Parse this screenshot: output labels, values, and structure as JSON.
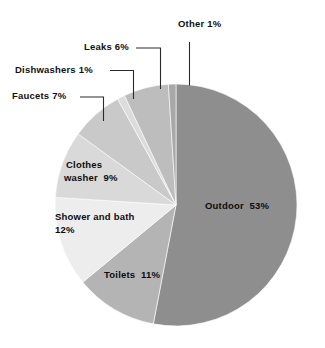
{
  "chart_data": {
    "type": "pie",
    "title": "",
    "subtitle": "",
    "xlabel": "",
    "ylabel": "",
    "legend_position": "none",
    "grid": false,
    "units": "percent",
    "start_angle_deg": 0,
    "direction": "clockwise",
    "categories": [
      "Outdoor",
      "Toilets",
      "Shower and bath",
      "Clothes washer",
      "Faucets",
      "Dishwashers",
      "Leaks",
      "Other"
    ],
    "values": [
      53,
      11,
      12,
      9,
      7,
      1,
      6,
      1
    ],
    "colors": [
      "#8e8e8e",
      "#b4b4b4",
      "#ededed",
      "#d9d9d9",
      "#c9c9c9",
      "#dcdcdc",
      "#bdbdbd",
      "#a8a8a8"
    ],
    "slices": [
      {
        "name": "Outdoor",
        "value": 53,
        "label": "Outdoor  53%",
        "color": "#8e8e8e",
        "label_placement": "inside"
      },
      {
        "name": "Toilets",
        "value": 11,
        "label": "Toilets  11%",
        "color": "#b4b4b4",
        "label_placement": "inside"
      },
      {
        "name": "Shower and bath",
        "value": 12,
        "label_line1": "Shower and bath",
        "label_line2": "12%",
        "color": "#ededed",
        "label_placement": "inside"
      },
      {
        "name": "Clothes washer",
        "value": 9,
        "label_line1": "Clothes",
        "label_line2": "washer  9%",
        "color": "#d9d9d9",
        "label_placement": "inside"
      },
      {
        "name": "Faucets",
        "value": 7,
        "label": "Faucets  7%",
        "color": "#c9c9c9",
        "label_placement": "callout"
      },
      {
        "name": "Dishwashers",
        "value": 1,
        "label": "Dishwashers  1%",
        "color": "#dcdcdc",
        "label_placement": "callout"
      },
      {
        "name": "Leaks",
        "value": 6,
        "label": "Leaks  6%",
        "color": "#bdbdbd",
        "label_placement": "callout"
      },
      {
        "name": "Other",
        "value": 1,
        "label": "Other  1%",
        "color": "#a8a8a8",
        "label_placement": "callout"
      }
    ]
  },
  "labels": {
    "other": "Other  1%",
    "leaks": "Leaks  6%",
    "dishwashers": "Dishwashers  1%",
    "faucets": "Faucets  7%",
    "clothes_washer_line1": "Clothes",
    "clothes_washer_line2": "washer  9%",
    "shower_line1": "Shower and bath",
    "shower_line2": "12%",
    "toilets": "Toilets  11%",
    "outdoor": "Outdoor  53%"
  }
}
